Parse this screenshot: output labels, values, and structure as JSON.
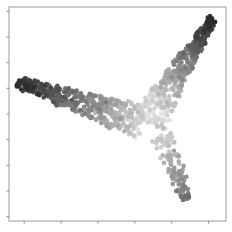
{
  "chart_data": {
    "type": "scatter",
    "title": "",
    "xlabel": "",
    "ylabel": "",
    "xlim": [
      0,
      100
    ],
    "ylim": [
      0,
      100
    ],
    "grid": false,
    "legend": "none",
    "colormap": "gray",
    "color_range": [
      "#2b2b2b",
      "#f2f2f2"
    ],
    "x_ticks": [
      7,
      24,
      41,
      58,
      75,
      92
    ],
    "y_ticks": [
      2,
      14,
      26,
      38,
      50,
      62,
      74,
      86,
      98
    ],
    "x_tick_labels": [],
    "y_tick_labels": [],
    "shape": {
      "description": "Two-armed manifold embedding: a dark left arm, a light central valley, and a dark upper-right arm with a lower tail",
      "left_tip": [
        4,
        65
      ],
      "valley_center": [
        65,
        50
      ],
      "upper_right_tip": [
        94,
        95
      ],
      "lower_tail": [
        81,
        10
      ]
    },
    "arms": [
      {
        "name": "left-arm",
        "from": [
          4,
          65
        ],
        "to": [
          62,
          46
        ],
        "width_from": 4,
        "width_to": 16,
        "t_from": 0.0,
        "t_to": 0.45,
        "n": 420
      },
      {
        "name": "right-arm",
        "from": [
          64,
          46
        ],
        "to": [
          94,
          95
        ],
        "width_from": 16,
        "width_to": 3,
        "t_from": 0.45,
        "t_to": 1.0,
        "n": 420
      },
      {
        "name": "lower-tail",
        "from": [
          70,
          40
        ],
        "to": [
          82,
          10
        ],
        "width_from": 10,
        "width_to": 4,
        "t_from": 0.55,
        "t_to": 0.8,
        "n": 120
      }
    ],
    "point_count": 960
  }
}
